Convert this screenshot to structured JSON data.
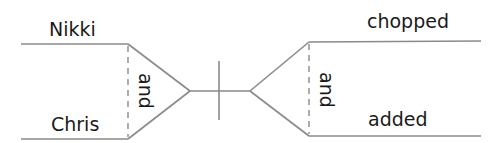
{
  "diagram": {
    "type": "sentence-diagram",
    "subject": {
      "words": [
        "Nikki",
        "Chris"
      ],
      "conjunction": "and"
    },
    "predicate": {
      "words": [
        "chopped",
        "added"
      ],
      "conjunction": "and"
    },
    "colors": {
      "line": "#8a8a8a",
      "text": "#1a1a1a",
      "background": "#ffffff"
    }
  }
}
